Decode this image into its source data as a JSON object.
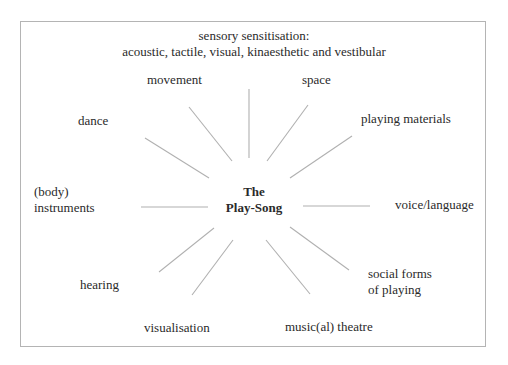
{
  "diagram": {
    "header": {
      "line1": "sensory sensitisation:",
      "line2": "acoustic, tactile, visual, kinaesthetic and vestibular"
    },
    "center": {
      "line1": "The",
      "line2": "Play-Song"
    },
    "nodes": {
      "movement": "movement",
      "space": "space",
      "dance": "dance",
      "playing_materials": "playing materials",
      "body_instruments_1": "(body)",
      "body_instruments_2": "instruments",
      "voice_language": "voice/language",
      "hearing": "hearing",
      "social_forms_1": "social forms",
      "social_forms_2": "of playing",
      "visualisation": "visualisation",
      "musical_theatre": "music(al) theatre"
    },
    "colors": {
      "line": "#b0b0b0",
      "frame": "#b4b4b4",
      "text": "#2a2a2a"
    }
  }
}
